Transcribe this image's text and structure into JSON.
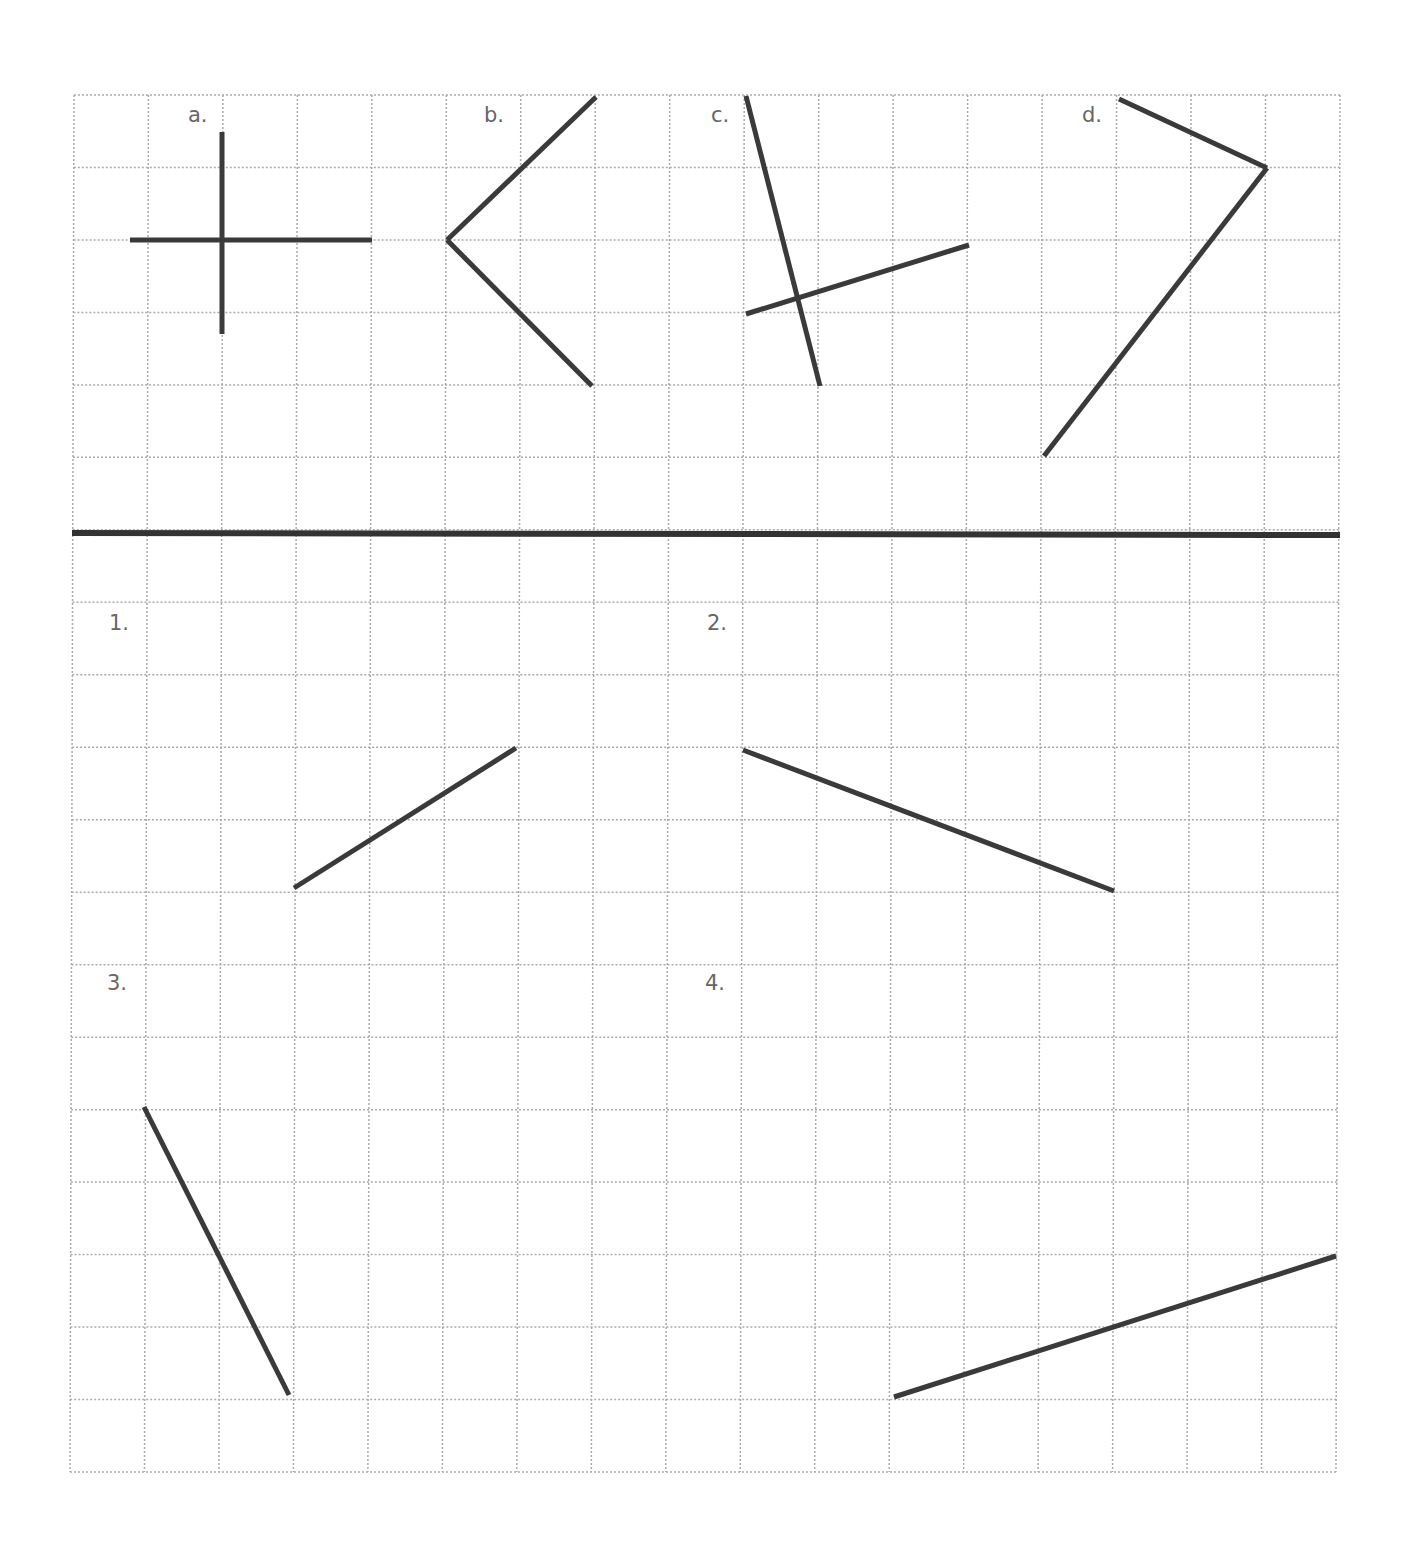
{
  "grid": {
    "cols": 17,
    "rows": 19,
    "x0": 72,
    "x1": 1338,
    "y0": 95,
    "y1": 1472,
    "line_color": "#aaaaaa",
    "divider_y": 533
  },
  "stroke_color": "#3a3a3a",
  "examples": [
    {
      "label": "a.",
      "lx": 188,
      "ly": 122,
      "segments": [
        [
          222,
          132,
          222,
          334
        ],
        [
          130,
          240,
          372,
          240
        ]
      ]
    },
    {
      "label": "b.",
      "lx": 484,
      "ly": 122,
      "segments": [
        [
          596,
          97,
          447,
          240
        ],
        [
          447,
          240,
          592,
          386
        ]
      ]
    },
    {
      "label": "c.",
      "lx": 711,
      "ly": 122,
      "segments": [
        [
          746,
          96,
          820,
          386
        ],
        [
          746,
          314,
          969,
          245
        ]
      ]
    },
    {
      "label": "d.",
      "lx": 1082,
      "ly": 122,
      "segments": [
        [
          1119,
          99,
          1267,
          168
        ],
        [
          1267,
          168,
          1044,
          456
        ]
      ]
    }
  ],
  "problems": [
    {
      "label": "1.",
      "lx": 109,
      "ly": 630,
      "segments": [
        [
          294,
          888,
          516,
          748
        ]
      ]
    },
    {
      "label": "2.",
      "lx": 707,
      "ly": 630,
      "segments": [
        [
          743,
          750,
          1114,
          891
        ]
      ]
    },
    {
      "label": "3.",
      "lx": 107,
      "ly": 990,
      "segments": [
        [
          144,
          1107,
          289,
          1395
        ]
      ]
    },
    {
      "label": "4.",
      "lx": 705,
      "ly": 990,
      "segments": [
        [
          894,
          1397,
          1336,
          1256
        ]
      ]
    }
  ]
}
